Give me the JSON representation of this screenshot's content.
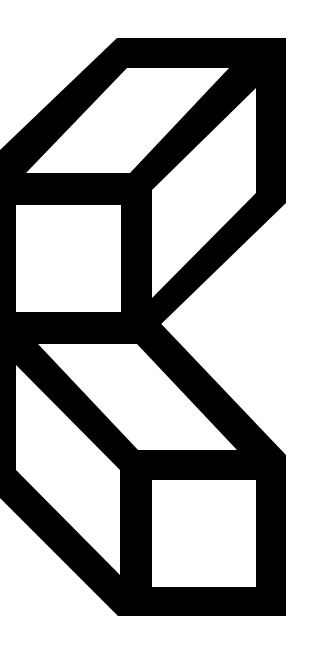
{
  "image": {
    "title": "Isometric K logo made of two stacked outlined cubes",
    "background_color": "#ffffff",
    "ink_color": "#000000"
  },
  "shapes": {
    "top_cube": {
      "label": "top-cube",
      "outer": "0,150 117,38 286,38 286,203 155,330 0,330",
      "holes": {
        "top_face": "127,68 229,68 130,173 26,173",
        "right_face": "256,88 256,193 152,298 152,190",
        "front_face": "16,205 121,205 121,312 16,312"
      }
    },
    "bottom_cube": {
      "label": "bottom-cube",
      "outer": "0,310 148,310 286,455 286,616 118,616 0,498",
      "holes": {
        "top_face": "38,344 137,344 237,450 138,450",
        "left_face": "16,365 120,470 120,575 16,470",
        "front_face": "152,480 256,480 256,587 152,587"
      }
    }
  }
}
